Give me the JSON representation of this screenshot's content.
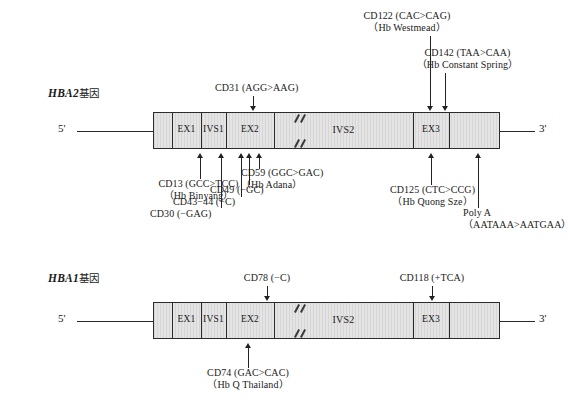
{
  "figure": {
    "genes": [
      {
        "id": "hba2",
        "name": "HBA2",
        "name_suffix": "基因",
        "five_prime": "5'",
        "three_prime": "3'",
        "segments": [
          {
            "label": "",
            "name": "utr5"
          },
          {
            "label": "EX1",
            "name": "exon1"
          },
          {
            "label": "IVS1",
            "name": "intron1"
          },
          {
            "label": "EX2",
            "name": "exon2"
          },
          {
            "label": "IVS2",
            "name": "intron2"
          },
          {
            "label": "EX3",
            "name": "exon3"
          },
          {
            "label": "",
            "name": "utr3"
          }
        ],
        "mutations_above": [
          {
            "line1": "CD31 (AGG>AAG)",
            "line2": ""
          },
          {
            "line1": "CD122 (CAC>CAG)",
            "line2": "（Hb Westmead）"
          },
          {
            "line1": "CD142 (TAA>CAA)",
            "line2": "（Hb Constant Spring）"
          }
        ],
        "mutations_below": [
          {
            "line1": "CD13 (GCC>TCC)",
            "line2": "（Hb Binyang）"
          },
          {
            "line1": "CD30 (−GAG)",
            "line2": ""
          },
          {
            "line1": "CD43−44 (−C)",
            "line2": ""
          },
          {
            "line1": "CD49 (−GC)",
            "line2": ""
          },
          {
            "line1": "CD59 (GGC>GAC)",
            "line2": "（Hb Adana）"
          },
          {
            "line1": "CD125 (CTC>CCG)",
            "line2": "（Hb Quong Sze）"
          },
          {
            "line1": "Poly A",
            "line2": "（AATAAA>AATGAA）"
          }
        ]
      },
      {
        "id": "hba1",
        "name": "HBA1",
        "name_suffix": "基因",
        "five_prime": "5'",
        "three_prime": "3'",
        "segments": [
          {
            "label": "",
            "name": "utr5"
          },
          {
            "label": "EX1",
            "name": "exon1"
          },
          {
            "label": "IVS1",
            "name": "intron1"
          },
          {
            "label": "EX2",
            "name": "exon2"
          },
          {
            "label": "IVS2",
            "name": "intron2"
          },
          {
            "label": "EX3",
            "name": "exon3"
          },
          {
            "label": "",
            "name": "utr3"
          }
        ],
        "mutations_above": [
          {
            "line1": "CD78 (−C)",
            "line2": ""
          },
          {
            "line1": "CD118 (+TCA)",
            "line2": ""
          }
        ],
        "mutations_below": [
          {
            "line1": "CD74 (GAC>CAC)",
            "line2": "（Hb Q Thailand）"
          }
        ]
      }
    ]
  },
  "colors": {
    "box_fill": "#e4e4e4",
    "stroke": "#2b2b2b",
    "text": "#1a1a1a"
  }
}
